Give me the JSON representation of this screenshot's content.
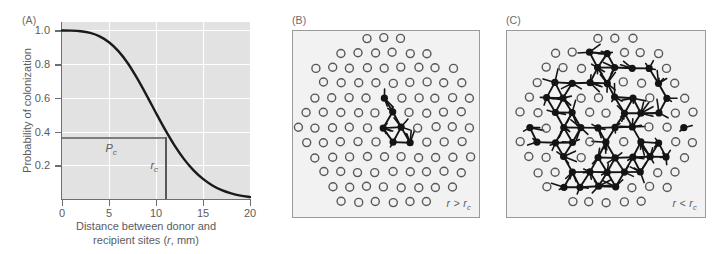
{
  "figure": {
    "panels": [
      {
        "letter": "(A)"
      },
      {
        "letter": "(B)"
      },
      {
        "letter": "(C)"
      }
    ]
  },
  "panel_a": {
    "letter": "(A)",
    "y_axis_title": "Probability of colonization",
    "x_axis_title_line1": "Distance between donor and",
    "x_axis_title_line2": "recipient sites (r, mm)",
    "y_ticklabels": [
      "1.0",
      "0.8",
      "0.6",
      "0.4",
      "0.2"
    ],
    "x_ticklabels": [
      "0",
      "5",
      "10",
      "15",
      "20"
    ],
    "annotation_pc": "P",
    "annotation_pc_sub": "c",
    "annotation_rc": "r",
    "annotation_rc_sub": "c",
    "plot_bg_color": "#e2e2e2",
    "gridline_color": "#ffffff",
    "curve_color": "#1a1a1a",
    "axis_color": "#6e6e70"
  },
  "panel_b": {
    "letter": "(B)",
    "condition_main": "r > r",
    "condition_sub": "c",
    "frame_bg_color": "#f2f2f2",
    "frame_border_color": "#9a9a9c",
    "open_site_color": "#58585a",
    "filled_site_color": "#141414"
  },
  "panel_c": {
    "letter": "(C)",
    "condition_main": "r < r",
    "condition_sub": "c",
    "frame_bg_color": "#f2f2f2",
    "frame_border_color": "#9a9a9c",
    "open_site_color": "#58585a",
    "filled_site_color": "#141414"
  },
  "chart_data": {
    "type": "line",
    "title": "",
    "xlabel": "Distance between donor and recipient sites (r, mm)",
    "ylabel": "Probability of colonization",
    "xlim": [
      0,
      20
    ],
    "ylim": [
      0,
      1.05
    ],
    "xticks": [
      0,
      5,
      10,
      15,
      20
    ],
    "yticks": [
      0.2,
      0.4,
      0.6,
      0.8,
      1.0
    ],
    "grid": true,
    "legend": null,
    "series": [
      {
        "name": "Probability of colonization",
        "x": [
          0,
          1,
          2,
          3,
          4,
          5,
          6,
          7,
          8,
          9,
          10,
          11,
          12,
          13,
          14,
          15,
          16,
          17,
          18,
          19,
          20
        ],
        "y": [
          1.0,
          0.999,
          0.995,
          0.985,
          0.965,
          0.93,
          0.877,
          0.805,
          0.715,
          0.615,
          0.51,
          0.408,
          0.315,
          0.235,
          0.17,
          0.119,
          0.08,
          0.052,
          0.033,
          0.02,
          0.012
        ]
      }
    ],
    "annotations": [
      {
        "label": "P_c",
        "type": "horizontal-line",
        "y": 0.368,
        "x_from": 0,
        "x_to": 11.0,
        "note": "critical colonization probability"
      },
      {
        "label": "r_c",
        "type": "vertical-line",
        "x": 11.0,
        "y_from": 0,
        "y_to": 0.368,
        "note": "critical distance"
      }
    ]
  }
}
